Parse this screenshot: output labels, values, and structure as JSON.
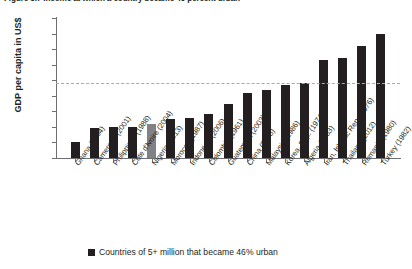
{
  "figure": {
    "title": "Figure 3.7  Income at which a country became 46 percent urban"
  },
  "chart_data": {
    "type": "bar",
    "title": "Figure 3.7  Income at which a country became 46 percent urban",
    "xlabel": "",
    "ylabel": "GDP per capita in US$",
    "ylim": [
      0,
      4500
    ],
    "ytick_labels": [
      "0",
      "500",
      "1,000",
      "1,500",
      "2,000",
      "2,500",
      "3,000",
      "3,500",
      "4,000",
      "4,500"
    ],
    "ytick_values": [
      0,
      500,
      1000,
      1500,
      2000,
      2500,
      3000,
      3500,
      4000,
      4500
    ],
    "grid": false,
    "legend_position": "bottom",
    "legend": [
      "Countries of 5+ million that became 46% urban"
    ],
    "reference_line": {
      "value": 2400,
      "style": "dashed",
      "color": "#a7a9ac"
    },
    "highlight_color": "#808285",
    "bar_color": "#231f20",
    "highlighted_category": "Nigeria (2013)",
    "categories": [
      "Ghana (2004)",
      "Cameroon (2001)",
      "Philippines (1988)",
      "Côte d'Ivoire (2004)",
      "Nigeria (2013)",
      "Morocco (1987)",
      "Indonesia (2006)",
      "Colombia (1961)",
      "Guatemala (2003)",
      "China (2008)",
      "Malaysia (1986)",
      "Korea, Rep. (1974)",
      "Algeria (1983)",
      "Iran, Islamic Rep. (1976)",
      "Thailand (2012)",
      "Romania (1980)",
      "Turkey (1982)"
    ],
    "values": [
      500,
      950,
      1000,
      1000,
      1100,
      1250,
      1300,
      1400,
      1750,
      2100,
      2200,
      2350,
      2400,
      3150,
      3200,
      3600,
      4000
    ]
  },
  "legend": {
    "items": [
      {
        "label": "Countries of 5+ million that became 46% urban",
        "color": "#231f20"
      }
    ]
  }
}
